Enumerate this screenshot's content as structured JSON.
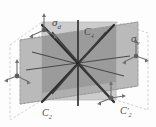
{
  "figure": {
    "kind": "symmetry-element-diagram",
    "background_color": "#fdfdfd",
    "plane_front_color": "#c9c9c9",
    "plane_back_color": "#a9a9a9",
    "plane_outline_color": "#b0b0b0",
    "axis_color": "#3a3a3a",
    "tripod_color": "#6e6e6e",
    "label_color": "#4a4a4a"
  },
  "labels": {
    "sigma_d": {
      "symbol": "σ",
      "sub": "d"
    },
    "c4": {
      "symbol": "C",
      "sub": "4"
    },
    "sigma_v": {
      "symbol": "σ",
      "sub": "v"
    },
    "c2": {
      "symbol": "C",
      "sub": "2"
    },
    "c2_prime": {
      "symbol": "C",
      "sub": "2",
      "prime": "′"
    }
  },
  "geometry": {
    "center": {
      "x": 78,
      "y": 63
    },
    "axes": [
      {
        "name": "c4-vertical-axis",
        "x1": 78,
        "y1": 22,
        "x2": 78,
        "y2": 105,
        "weight": 1.6
      },
      {
        "name": "c2-axis-a",
        "x1": 44,
        "y1": 26,
        "x2": 112,
        "y2": 100,
        "weight": 2.4
      },
      {
        "name": "c2-axis-b",
        "x1": 112,
        "y1": 26,
        "x2": 44,
        "y2": 100,
        "weight": 2.4
      },
      {
        "name": "c2-axis-c",
        "x1": 28,
        "y1": 70,
        "x2": 128,
        "y2": 56,
        "weight": 1.3
      },
      {
        "name": "c2-axis-d",
        "x1": 34,
        "y1": 52,
        "x2": 122,
        "y2": 74,
        "weight": 1.3
      }
    ],
    "tripods": [
      {
        "name": "tripod-top-left",
        "x": 44,
        "y": 27
      },
      {
        "name": "tripod-right",
        "x": 134,
        "y": 52
      },
      {
        "name": "tripod-left",
        "x": 17,
        "y": 72
      },
      {
        "name": "tripod-bottom-right",
        "x": 112,
        "y": 98
      }
    ]
  }
}
